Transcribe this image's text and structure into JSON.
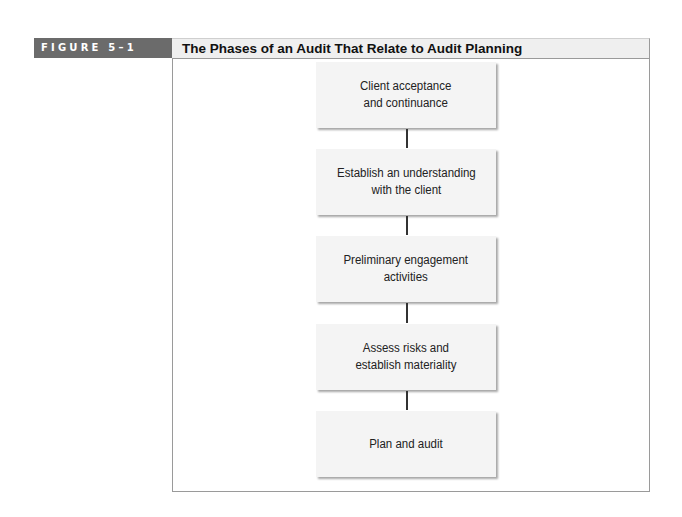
{
  "figure": {
    "label": "FIGURE 5–1",
    "title": "The Phases of an Audit That Relate to Audit Planning"
  },
  "flowchart": {
    "steps": [
      {
        "label": "Client acceptance\nand continuance"
      },
      {
        "label": "Establish an understanding\nwith the client"
      },
      {
        "label": "Preliminary engagement\nactivities"
      },
      {
        "label": "Assess risks and\nestablish materiality"
      },
      {
        "label": "Plan and audit"
      }
    ],
    "connectors": 4
  },
  "colors": {
    "label_background": "#6b6b6b",
    "header_background": "#efefef",
    "box_fill": "#f4f4f4",
    "frame_border": "#9a9a9a"
  }
}
